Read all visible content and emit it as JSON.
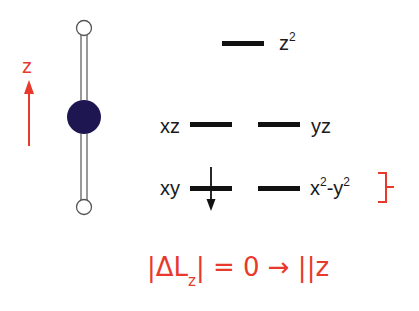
{
  "molecule": {
    "axis_label": "z",
    "axis_color": "#e8392c",
    "central_atom_color": "#1e1650",
    "ligand_atom_color": "#ffffff",
    "ligand_count": 2,
    "geometry": "linear"
  },
  "orbitals": {
    "z2": {
      "label": "z",
      "sup": "2"
    },
    "xz": {
      "label": "xz"
    },
    "yz": {
      "label": "yz"
    },
    "xy": {
      "label": "xy",
      "electron": "spin-down"
    },
    "x2y2": {
      "label_a": "x",
      "sup_a": "2",
      "label_b": "-y",
      "sup_b": "2"
    }
  },
  "bracket": {
    "color": "#e8392c",
    "groups": [
      "xy",
      "x2-y2"
    ]
  },
  "selection_rule": {
    "open_bar": "|",
    "delta": "ΔL",
    "sub": "z",
    "close_bar": "|",
    "equals": " = 0 ",
    "arrow": "→",
    "parallel": " ||z",
    "color": "#e8392c"
  }
}
